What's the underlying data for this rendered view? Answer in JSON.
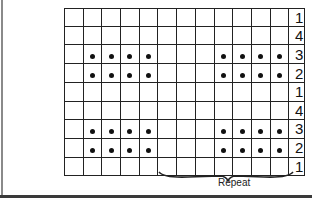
{
  "chart": {
    "title": "",
    "columns": 12,
    "rows": [
      {
        "label": "1",
        "dots": []
      },
      {
        "label": "4",
        "dots": []
      },
      {
        "label": "3",
        "dots": [
          1,
          2,
          3,
          4,
          8,
          9,
          10,
          11
        ]
      },
      {
        "label": "2",
        "dots": [
          1,
          2,
          3,
          4,
          8,
          9,
          10,
          11
        ]
      },
      {
        "label": "1",
        "dots": []
      },
      {
        "label": "4",
        "dots": []
      },
      {
        "label": "3",
        "dots": [
          1,
          2,
          3,
          4,
          8,
          9,
          10,
          11
        ]
      },
      {
        "label": "2",
        "dots": [
          1,
          2,
          3,
          4,
          8,
          9,
          10,
          11
        ]
      },
      {
        "label": "1",
        "dots": []
      }
    ],
    "repeat_label": "Repeat",
    "repeat_span_columns": [
      5,
      11
    ],
    "dot_symbol": "purl-dot-icon",
    "line_color": "#222222",
    "dot_color": "#111111"
  }
}
